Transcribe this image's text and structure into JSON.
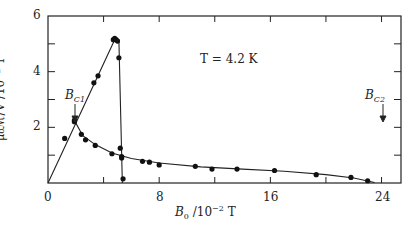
{
  "chart_data": {
    "type": "line",
    "title": "",
    "xlabel": "B0 /10^-2 T",
    "ylabel": "μ0 M/V /10^-2 T",
    "xlim": [
      0,
      25.4
    ],
    "ylim": [
      0,
      6
    ],
    "x_ticks": [
      0,
      4,
      8,
      12,
      16,
      20,
      24
    ],
    "x_tick_labels": [
      "0",
      "8",
      "16",
      "24"
    ],
    "y_ticks": [
      0,
      1,
      2,
      3,
      4,
      5,
      6
    ],
    "y_tick_labels": [
      "2",
      "4",
      "6"
    ],
    "grid": false,
    "annotations": [
      {
        "text": "T = 4.2 K",
        "x": 13.5,
        "y": 4.6
      },
      {
        "text": "B_C1",
        "x": 1.9,
        "y": 2.3,
        "arrow": true
      },
      {
        "text": "B_C2",
        "x": 23.3,
        "y": 2.3,
        "arrow": true
      }
    ],
    "series": [
      {
        "name": "increasing field (Meissner rise and drop)",
        "x": [
          0,
          1.2,
          1.9,
          3.3,
          3.6,
          4.7,
          4.8,
          4.9,
          5.0,
          5.1,
          5.2,
          5.3,
          5.4
        ],
        "y": [
          0,
          1.6,
          2.2,
          3.6,
          3.85,
          5.15,
          5.2,
          5.15,
          5.1,
          4.5,
          1.25,
          0.95,
          0.15
        ]
      },
      {
        "name": "decreasing branch (mixed state)",
        "x": [
          1.9,
          2.4,
          2.7,
          3.4,
          4.6,
          5.3,
          6.8,
          7.3,
          8.0,
          10.6,
          11.8,
          13.6,
          16.3,
          19.3,
          21.8,
          23.0
        ],
        "y": [
          2.25,
          1.75,
          1.55,
          1.35,
          1.05,
          0.9,
          0.78,
          0.75,
          0.65,
          0.6,
          0.5,
          0.5,
          0.45,
          0.3,
          0.2,
          0.08
        ]
      }
    ]
  },
  "labels": {
    "y_axis": "μ₀ℳ/V  /10⁻² T",
    "x_axis_main": "B",
    "x_axis_sub": "0",
    "x_axis_unit": " /10",
    "x_axis_exp": "−2",
    "x_axis_tail": " T",
    "temperature": "T = 4.2 K",
    "bc1_main": "B",
    "bc1_sub": "C1",
    "bc2_main": "B",
    "bc2_sub": "C2",
    "tick_x0": "0",
    "tick_x8": "8",
    "tick_x16": "16",
    "tick_x24": "24",
    "tick_y2": "2",
    "tick_y4": "4",
    "tick_y6": "6"
  }
}
